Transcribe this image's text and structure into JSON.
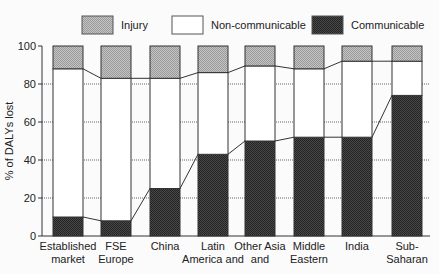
{
  "chart_data": {
    "type": "bar",
    "stacked": true,
    "title": "",
    "xlabel": "",
    "ylabel": "% of DALYs lost",
    "ylim": [
      0,
      100
    ],
    "yticks": [
      0,
      20,
      40,
      60,
      80,
      100
    ],
    "grid": "dashed horizontal at 20,40,60,80 between bars",
    "legend_position": "top",
    "categories": [
      [
        "Established",
        "market"
      ],
      [
        "FSE",
        "Europe"
      ],
      [
        "China"
      ],
      [
        "Latin",
        "America and"
      ],
      [
        "Other Asia",
        "and"
      ],
      [
        "Middle",
        "Eastern"
      ],
      [
        "India"
      ],
      [
        "Sub-",
        "Saharan"
      ]
    ],
    "series": [
      {
        "name": "Communicable",
        "color": "#3a3a3a",
        "values": [
          10,
          8,
          25,
          43,
          50,
          52,
          52,
          74
        ]
      },
      {
        "name": "Non-communicable",
        "color": "#ffffff",
        "values": [
          78,
          75,
          58,
          43,
          39.5,
          36,
          40,
          18
        ]
      },
      {
        "name": "Injury",
        "color": "#b0b0b0",
        "values": [
          12,
          17,
          17,
          14,
          10.5,
          12,
          8,
          8
        ]
      }
    ],
    "cumulative_top_of_communicable": [
      10,
      8,
      25,
      43,
      50,
      52,
      52,
      74
    ],
    "cumulative_top_of_noncommunicable": [
      88,
      83,
      83,
      86,
      89.5,
      88,
      92,
      92
    ]
  },
  "legend": [
    {
      "label": "Injury",
      "color": "#b0b0b0"
    },
    {
      "label": "Non-communicable",
      "color": "#ffffff"
    },
    {
      "label": "Communicable",
      "color": "#3a3a3a"
    }
  ]
}
